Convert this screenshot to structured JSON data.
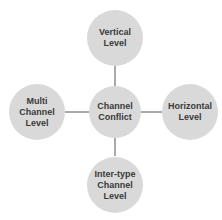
{
  "diagram": {
    "title": "",
    "colors": {
      "node_fill": "#d9d9d9",
      "connector": "#555555",
      "text": "#3a3a3a"
    },
    "center": {
      "label": "Channel\nConflict"
    },
    "nodes": [
      {
        "id": "top",
        "label": "Vertical\nLevel"
      },
      {
        "id": "left",
        "label": "Multi\nChannel\nLevel"
      },
      {
        "id": "right",
        "label": "Horizontal\nLevel"
      },
      {
        "id": "bottom",
        "label": "Inter-type\nChannel\nLevel"
      }
    ],
    "edges": [
      {
        "from": "center",
        "to": "top"
      },
      {
        "from": "center",
        "to": "left"
      },
      {
        "from": "center",
        "to": "right"
      },
      {
        "from": "center",
        "to": "bottom"
      }
    ]
  }
}
